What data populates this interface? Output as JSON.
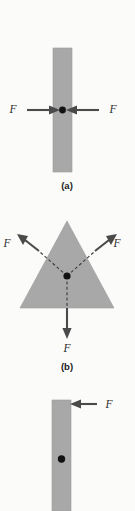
{
  "figure": {
    "background_color": "#fbfbfa",
    "body_color": "#a8a8a8",
    "arrow_color": "#4a4a4a",
    "dot_color": "#121212",
    "width": 135,
    "height": 511
  },
  "panels": [
    {
      "id": "a",
      "caption": "(a)",
      "shape": "vertical-bar",
      "forces": [
        {
          "label": "F",
          "direction": "right",
          "label_x": 13,
          "label_y": 113
        },
        {
          "label": "F",
          "direction": "left",
          "label_x": 113,
          "label_y": 113
        }
      ]
    },
    {
      "id": "b",
      "caption": "(b)",
      "shape": "triangle",
      "forces": [
        {
          "label": "F",
          "direction": "up-left",
          "label_x": 7,
          "label_y": 247
        },
        {
          "label": "F",
          "direction": "up-right",
          "label_x": 117,
          "label_y": 247
        },
        {
          "label": "F",
          "direction": "down",
          "label_x": 63,
          "label_y": 352
        }
      ]
    },
    {
      "id": "c",
      "caption": "",
      "shape": "vertical-bar",
      "forces": [
        {
          "label": "F",
          "direction": "left",
          "label_x": 107,
          "label_y": 407
        }
      ]
    }
  ]
}
